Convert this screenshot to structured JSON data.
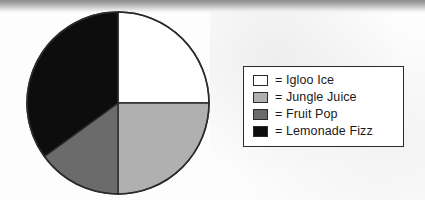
{
  "chart_data": {
    "type": "pie",
    "title": "",
    "categories": [
      "Igloo Ice",
      "Jungle Juice",
      "Fruit Pop",
      "Lemonade Fizz"
    ],
    "values": [
      25,
      25,
      15,
      35
    ],
    "units": "percent",
    "start_angle_deg": 0,
    "direction": "clockwise",
    "legend_position": "right",
    "grid": false,
    "slices": [
      {
        "label": "Igloo Ice",
        "value": 25,
        "start_deg": 0,
        "end_deg": 90,
        "color": "#ffffff"
      },
      {
        "label": "Jungle Juice",
        "value": 25,
        "start_deg": 90,
        "end_deg": 180,
        "color": "#b0b0b0"
      },
      {
        "label": "Fruit Pop",
        "value": 15,
        "start_deg": 180,
        "end_deg": 234,
        "color": "#6b6b6b"
      },
      {
        "label": "Lemonade Fizz",
        "value": 35,
        "start_deg": 234,
        "end_deg": 360,
        "color": "#0d0d0d"
      }
    ]
  },
  "pie": {
    "center_x": 92,
    "center_y": 92,
    "radius": 91,
    "outline_color": "#2b2b2b"
  },
  "legend": {
    "equals_sign": "=",
    "items": [
      {
        "label": "Igloo Ice",
        "swatch_color": "#ffffff"
      },
      {
        "label": "Jungle Juice",
        "swatch_color": "#b0b0b0"
      },
      {
        "label": "Fruit Pop",
        "swatch_color": "#6b6b6b"
      },
      {
        "label": "Lemonade Fizz",
        "swatch_color": "#0d0d0d"
      }
    ]
  }
}
